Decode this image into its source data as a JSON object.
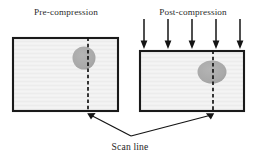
{
  "figure": {
    "title_left": "Pre-compression",
    "title_right": "Post-compression",
    "caption": "Scan line"
  },
  "colors": {
    "specimen_fill": "#f1f1f1",
    "specimen_stroke": "#1a1a1a",
    "inclusion_fill": "#a9a9a9",
    "line": "#141414",
    "background": "#ffffff",
    "text": "#262626"
  },
  "panels": [
    {
      "id": "pre-compression",
      "label": "Pre-compression",
      "label_x": 66,
      "label_y": 15,
      "specimen": {
        "x": 13,
        "y": 38,
        "width": 105,
        "height": 73,
        "stroke_width": 2.1
      },
      "inclusion": {
        "cx": 84,
        "cy": 58,
        "rx": 11.5,
        "ry": 11.5
      },
      "scan_line": {
        "x": 88,
        "y1": 38,
        "y2": 112
      },
      "load_arrows": []
    },
    {
      "id": "post-compression",
      "label": "Post-compression",
      "label_x": 193,
      "label_y": 15,
      "specimen": {
        "x": 140,
        "y": 51,
        "width": 104,
        "height": 60,
        "stroke_width": 2.1
      },
      "inclusion": {
        "cx": 212,
        "cy": 72,
        "rx": 14.5,
        "ry": 11.5
      },
      "scan_line": {
        "x": 213,
        "y1": 51,
        "y2": 112
      },
      "load_arrows": [
        {
          "x": 144,
          "y_top": 19,
          "y_tip": 48
        },
        {
          "x": 168,
          "y_top": 19,
          "y_tip": 48
        },
        {
          "x": 192,
          "y_top": 19,
          "y_tip": 48
        },
        {
          "x": 216,
          "y_top": 19,
          "y_tip": 48
        },
        {
          "x": 240,
          "y_top": 19,
          "y_tip": 48
        }
      ]
    }
  ],
  "callout": {
    "label": "Scan line",
    "label_x": 130,
    "label_y": 150,
    "vertex": {
      "x": 131,
      "y": 136
    },
    "arrows": [
      {
        "from_x": 131,
        "from_y": 136,
        "to_x": 88,
        "to_y": 113
      },
      {
        "from_x": 131,
        "from_y": 136,
        "to_x": 213,
        "to_y": 113
      }
    ]
  }
}
